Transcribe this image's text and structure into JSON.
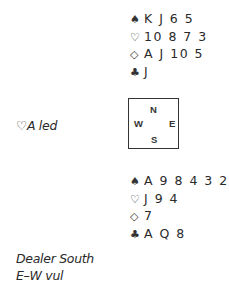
{
  "north": {
    "spades": {
      "symbol": "♠",
      "cards": "K J 6 5"
    },
    "hearts": {
      "symbol": "♡",
      "cards": "10 8 7 3"
    },
    "diamonds": {
      "symbol": "◇",
      "cards": "A J 10 5"
    },
    "clubs": {
      "symbol": "♣",
      "cards": "J"
    }
  },
  "compass": {
    "north": "N",
    "south": "S",
    "west": "W",
    "east": "E"
  },
  "opening_lead": "♡A led",
  "south": {
    "spades": {
      "symbol": "♠",
      "cards": "A 9 8 4 3 2"
    },
    "hearts": {
      "symbol": "♡",
      "cards": "J 9 4"
    },
    "diamonds": {
      "symbol": "◇",
      "cards": "7"
    },
    "clubs": {
      "symbol": "♣",
      "cards": "A Q 8"
    }
  },
  "notes": {
    "dealer": "Dealer South",
    "vulnerability": "E–W vul"
  }
}
